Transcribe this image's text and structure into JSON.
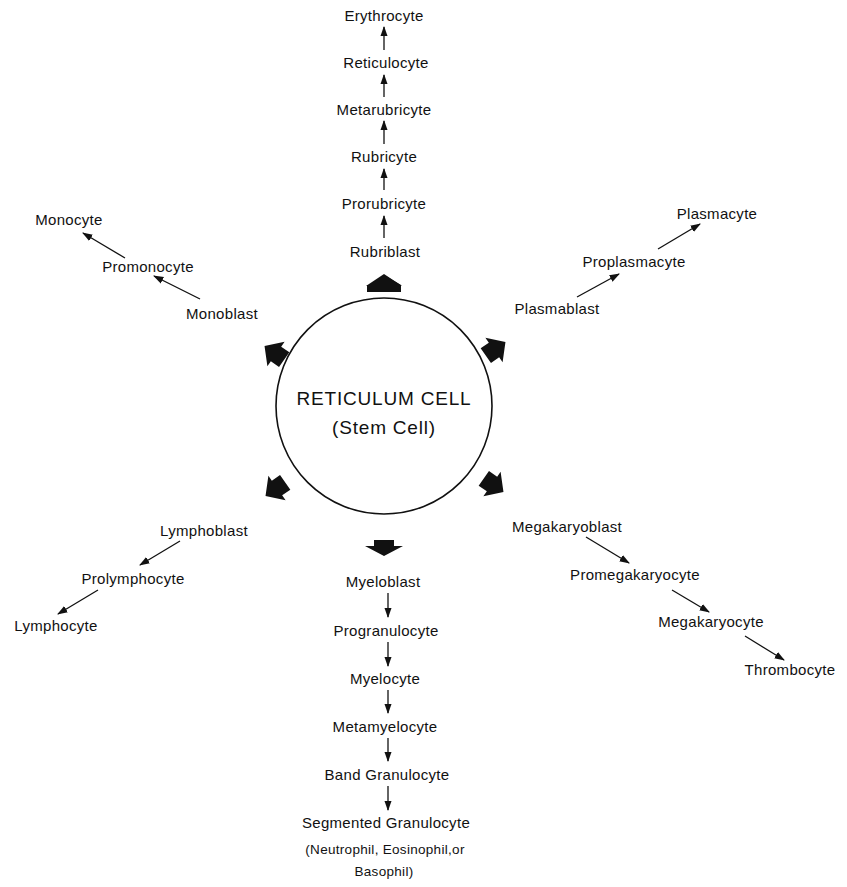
{
  "diagram": {
    "center": {
      "title": "RETICULUM CELL",
      "subtitle": "(Stem Cell)"
    },
    "lineages": {
      "erythrocytic": {
        "direction": "up",
        "stages": [
          "Rubriblast",
          "Prorubricyte",
          "Rubricyte",
          "Metarubricyte",
          "Reticulocyte",
          "Erythrocyte"
        ]
      },
      "monocytic": {
        "direction": "up-left",
        "stages": [
          "Monoblast",
          "Promonocyte",
          "Monocyte"
        ]
      },
      "plasmacytic": {
        "direction": "up-right",
        "stages": [
          "Plasmablast",
          "Proplasmacyte",
          "Plasmacyte"
        ]
      },
      "lymphocytic": {
        "direction": "down-left",
        "stages": [
          "Lymphoblast",
          "Prolymphocyte",
          "Lymphocyte"
        ]
      },
      "granulocytic": {
        "direction": "down",
        "stages": [
          "Myeloblast",
          "Progranulocyte",
          "Myelocyte",
          "Metamyelocyte",
          "Band Granulocyte",
          "Segmented Granulocyte"
        ],
        "note_line1": "(Neutrophil, Eosinophil,or",
        "note_line2": "Basophil)"
      },
      "megakaryocytic": {
        "direction": "down-right",
        "stages": [
          "Megakaryoblast",
          "Promegakaryocyte",
          "Megakaryocyte",
          "Thrombocyte"
        ]
      }
    },
    "colors": {
      "ink": "#111111",
      "background": "#ffffff"
    }
  }
}
